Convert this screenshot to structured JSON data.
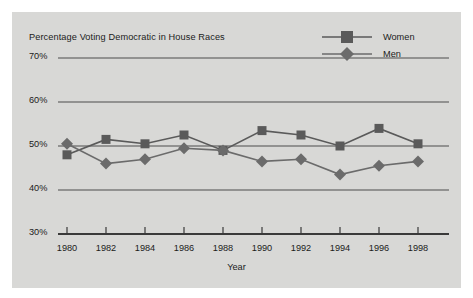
{
  "chart_data": {
    "type": "line",
    "title": "Percentage Voting Democratic in House Races",
    "xlabel": "Year",
    "ylabel": "",
    "x": [
      1980,
      1982,
      1984,
      1986,
      1988,
      1990,
      1992,
      1994,
      1996,
      1998
    ],
    "categories": [
      "1980",
      "1982",
      "1984",
      "1986",
      "1988",
      "1990",
      "1992",
      "1994",
      "1996",
      "1998"
    ],
    "series": [
      {
        "name": "Women",
        "marker": "square",
        "color": "#5a5a5a",
        "values": [
          48,
          51.5,
          50.5,
          52.5,
          49,
          53.5,
          52.5,
          50,
          54,
          50.5
        ]
      },
      {
        "name": "Men",
        "marker": "diamond",
        "color": "#6b6b6b",
        "values": [
          50.5,
          46,
          47,
          49.5,
          49,
          46.5,
          47,
          43.5,
          45.5,
          46.5
        ]
      }
    ],
    "ylim": [
      30,
      70
    ],
    "xlim": [
      1979,
      1999
    ],
    "yticks": [
      30,
      40,
      50,
      60,
      70
    ],
    "ytick_labels": [
      "30%",
      "40%",
      "50%",
      "60%",
      "70%"
    ],
    "grid": true,
    "gridlines_at": [
      30,
      40,
      50,
      60,
      70
    ],
    "legend_position": "top-right",
    "legend": [
      {
        "label": "Women",
        "marker": "square"
      },
      {
        "label": "Men",
        "marker": "diamond"
      }
    ],
    "background_color": "#d8d8d6",
    "line_color": "#4d4d4d"
  }
}
